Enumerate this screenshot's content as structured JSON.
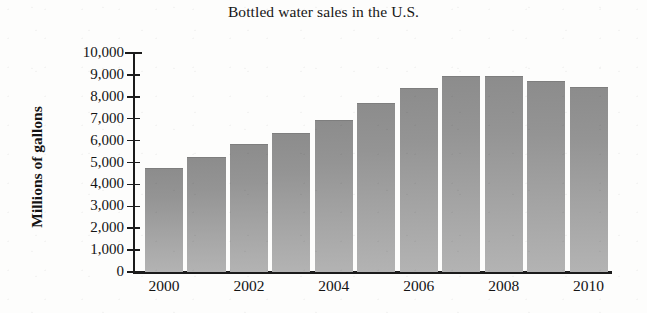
{
  "chart_data": {
    "type": "bar",
    "title": "Bottled water sales in the U.S.",
    "xlabel": "",
    "ylabel": "Millions of gallons",
    "categories": [
      "2000",
      "2001",
      "2002",
      "2003",
      "2004",
      "2005",
      "2006",
      "2007",
      "2008",
      "2009",
      "2010"
    ],
    "values": [
      4750,
      5250,
      5850,
      6350,
      6950,
      7700,
      8400,
      8950,
      8950,
      8700,
      8450
    ],
    "ylim": [
      0,
      10000
    ],
    "ytick_values": [
      0,
      1000,
      2000,
      3000,
      4000,
      5000,
      6000,
      7000,
      8000,
      9000,
      10000
    ],
    "ytick_labels": [
      "0",
      "1,000",
      "2,000",
      "3,000",
      "4,000",
      "5,000",
      "6,000",
      "7,000",
      "8,000",
      "9,000",
      "10,000"
    ],
    "xtick_labels": [
      "2000",
      "2002",
      "2004",
      "2006",
      "2008",
      "2010"
    ],
    "xtick_categories": [
      "2000",
      "2002",
      "2004",
      "2006",
      "2008",
      "2010"
    ],
    "grid": false,
    "legend": null,
    "bar_color_top": "#8c8c8c",
    "bar_color_bottom": "#b3b3b3",
    "axis_color": "#1b1b1b",
    "background_color": "#fdfdfc"
  }
}
